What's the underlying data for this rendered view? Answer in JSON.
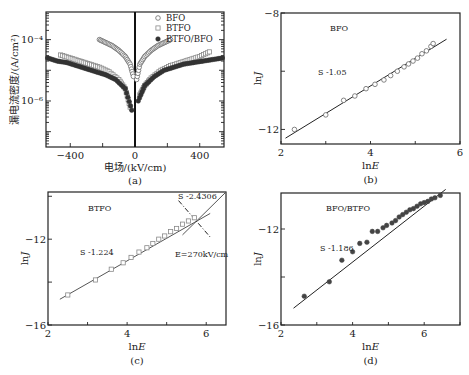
{
  "chart_data": [
    {
      "id": "a",
      "type": "scatter",
      "caption": "(a)",
      "xlabel": "电场/(kV/cm)",
      "ylabel": "漏电流密度/(A/cm²)",
      "xlim": [
        -550,
        550
      ],
      "yscale": "log",
      "ylim_log10": [
        -7.5,
        -3.1
      ],
      "xticks": [
        -400,
        0,
        400
      ],
      "xtick_labels": [
        "−400",
        "0",
        "400"
      ],
      "yticks_log10": [
        -4,
        -6
      ],
      "ytick_labels": [
        "10⁻⁴",
        "10⁻⁶"
      ],
      "legend": [
        "BFO",
        "BTFO",
        "BTFO/BFO"
      ],
      "legend_position": "upper right",
      "series": [
        {
          "name": "BFO",
          "marker": "open-circle",
          "color": "#777777",
          "x": [
            -220,
            -180,
            -140,
            -100,
            -60,
            -30,
            -10,
            10,
            30,
            60,
            100,
            140,
            180,
            220
          ],
          "log10_y": [
            -4.0,
            -4.1,
            -4.2,
            -4.35,
            -4.55,
            -4.8,
            -5.2,
            -5.3,
            -4.8,
            -4.55,
            -4.35,
            -4.2,
            -4.1,
            -4.0
          ]
        },
        {
          "name": "BTFO",
          "marker": "open-square",
          "color": "#888888",
          "x": [
            -460,
            -400,
            -340,
            -280,
            -220,
            -160,
            -100,
            -60,
            -30,
            30,
            60,
            100,
            160,
            220,
            280,
            340,
            400,
            460
          ],
          "log10_y": [
            -4.5,
            -4.6,
            -4.7,
            -4.8,
            -4.9,
            -5.05,
            -5.3,
            -5.6,
            -6.2,
            -5.8,
            -5.5,
            -5.25,
            -5.0,
            -4.85,
            -4.75,
            -4.65,
            -4.55,
            -4.4
          ]
        },
        {
          "name": "BTFO/BFO",
          "marker": "filled-circle",
          "color": "#333333",
          "x": [
            -540,
            -480,
            -420,
            -360,
            -300,
            -240,
            -180,
            -120,
            -60,
            -20,
            20,
            60,
            120,
            180,
            240,
            300,
            360,
            420,
            480,
            540
          ],
          "log10_y": [
            -4.6,
            -4.7,
            -4.75,
            -4.85,
            -4.95,
            -5.05,
            -5.15,
            -5.3,
            -5.6,
            -6.3,
            -6.0,
            -5.5,
            -5.2,
            -5.0,
            -4.9,
            -4.8,
            -4.75,
            -4.7,
            -4.65,
            -4.6
          ]
        }
      ],
      "annotations": [
        "vertical line at E=0"
      ]
    },
    {
      "id": "b",
      "type": "scatter",
      "caption": "(b)",
      "title": "BFO",
      "xlabel": "ln E",
      "ylabel": "ln J",
      "xlim": [
        2,
        6
      ],
      "ylim": [
        -12.5,
        -8
      ],
      "xticks": [
        2,
        4,
        6
      ],
      "yticks": [
        -12,
        -8
      ],
      "series": [
        {
          "name": "BFO",
          "marker": "open-circle",
          "x": [
            2.3,
            3.0,
            3.4,
            3.65,
            3.9,
            4.1,
            4.3,
            4.45,
            4.6,
            4.75,
            4.85,
            4.95,
            5.05,
            5.15,
            5.25,
            5.35,
            5.4
          ],
          "y": [
            -12.0,
            -11.5,
            -11.0,
            -10.85,
            -10.6,
            -10.45,
            -10.3,
            -10.15,
            -10.0,
            -9.85,
            -9.75,
            -9.65,
            -9.55,
            -9.4,
            -9.3,
            -9.15,
            -9.05
          ]
        },
        {
          "name": "fit",
          "type": "line",
          "x": [
            2.1,
            5.7
          ],
          "y": [
            -12.3,
            -8.9
          ]
        }
      ],
      "annotations": [
        "S -1.05"
      ]
    },
    {
      "id": "c",
      "type": "scatter",
      "caption": "(c)",
      "title": "BTFO",
      "xlabel": "ln E",
      "ylabel": "ln J",
      "xlim": [
        2,
        6.5
      ],
      "ylim": [
        -16,
        -9.8
      ],
      "xticks": [
        2,
        4,
        6
      ],
      "yticks": [
        -12,
        -16
      ],
      "series": [
        {
          "name": "BTFO",
          "marker": "open-square",
          "x": [
            2.5,
            3.2,
            3.6,
            3.9,
            4.1,
            4.3,
            4.5,
            4.65,
            4.8,
            4.95,
            5.1,
            5.25,
            5.4,
            5.55,
            5.7
          ],
          "y": [
            -14.6,
            -13.9,
            -13.4,
            -13.1,
            -12.85,
            -12.6,
            -12.4,
            -12.2,
            -12.0,
            -11.85,
            -11.65,
            -11.5,
            -11.3,
            -11.15,
            -11.0
          ]
        },
        {
          "name": "fit-low",
          "type": "line",
          "x": [
            2.3,
            6.1
          ],
          "y": [
            -14.8,
            -10.8
          ]
        },
        {
          "name": "fit-high",
          "type": "line",
          "x": [
            5.4,
            6.5
          ],
          "y": [
            -11.8,
            -9.8
          ]
        },
        {
          "name": "crossover",
          "type": "dash-dot",
          "x": [
            5.3,
            6.1
          ],
          "y": [
            -10.2,
            -11.9
          ]
        }
      ],
      "annotations": [
        "S -1.224",
        "S -2.4306",
        "E=270kV/cm"
      ]
    },
    {
      "id": "d",
      "type": "scatter",
      "caption": "(d)",
      "title": "BFO/BTFO",
      "xlabel": "ln E",
      "ylabel": "ln J",
      "xlim": [
        2,
        7
      ],
      "ylim": [
        -16,
        -10.5
      ],
      "xticks": [
        2,
        4,
        6
      ],
      "yticks": [
        -12,
        -16
      ],
      "series": [
        {
          "name": "BFO/BTFO",
          "marker": "filled-circle",
          "x": [
            2.65,
            3.35,
            3.7,
            4.0,
            4.2,
            4.4,
            4.55,
            4.7,
            4.85,
            4.95,
            5.1,
            5.2,
            5.3,
            5.4,
            5.5,
            5.6,
            5.7,
            5.8,
            5.9,
            6.0,
            6.1,
            6.2,
            6.3,
            6.45
          ],
          "y": [
            -14.8,
            -14.2,
            -13.3,
            -12.95,
            -12.6,
            -12.55,
            -12.1,
            -12.1,
            -11.95,
            -11.85,
            -11.75,
            -11.65,
            -11.5,
            -11.4,
            -11.3,
            -11.2,
            -11.15,
            -11.05,
            -10.95,
            -10.9,
            -10.85,
            -10.75,
            -10.7,
            -10.6
          ]
        },
        {
          "name": "fit",
          "type": "line",
          "x": [
            2.35,
            6.6
          ],
          "y": [
            -15.3,
            -10.35
          ]
        }
      ],
      "annotations": [
        "S -1.186"
      ]
    }
  ],
  "panels": {
    "a": {
      "caption": "(a)",
      "xlabel": "电场/(kV/cm)",
      "ylabel": "漏电流密度/(A/cm²)",
      "legend": [
        {
          "label": "BFO"
        },
        {
          "label": "BTFO"
        },
        {
          "label": "BTFO/BFO"
        }
      ]
    },
    "b": {
      "caption": "(b)",
      "title": "BFO",
      "xlabel": "ln E",
      "ylabel": "ln J",
      "slope": "S -1.05"
    },
    "c": {
      "caption": "(c)",
      "title": "BTFO",
      "xlabel": "ln E",
      "ylabel": "ln J",
      "slope1": "S -1.224",
      "slope2": "S -2.4306",
      "crossover": "E=270kV/cm"
    },
    "d": {
      "caption": "(d)",
      "title": "BFO/BTFO",
      "xlabel": "ln E",
      "ylabel": "ln J",
      "slope": "S -1.186"
    }
  }
}
